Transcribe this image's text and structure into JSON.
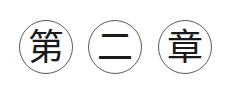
{
  "heading": {
    "characters": [
      {
        "char": "第",
        "meaning": "ordinal prefix"
      },
      {
        "char": "二",
        "meaning": "two"
      },
      {
        "char": "章",
        "meaning": "chapter"
      }
    ],
    "text": "第二章",
    "colors": {
      "circle_border": "#5a5a5a",
      "text": "#1a1a1a",
      "background": "#ffffff"
    }
  }
}
